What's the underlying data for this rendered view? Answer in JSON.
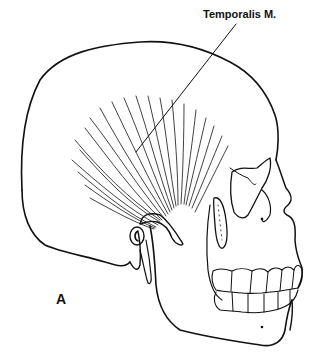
{
  "figure": {
    "labels": {
      "muscle": "Temporalis M.",
      "panel": "A"
    },
    "colors": {
      "line": "#111111",
      "background": "#ffffff"
    }
  }
}
